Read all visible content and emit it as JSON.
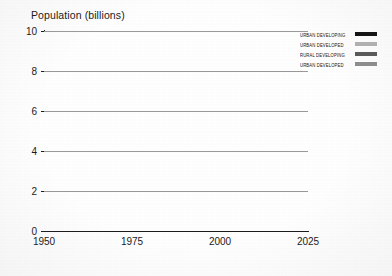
{
  "chart_data": {
    "type": "line",
    "title": "Population (billions)",
    "xlabel": "",
    "ylabel": "Population (billions)",
    "xlim": [
      1950,
      2025
    ],
    "ylim": [
      0,
      10
    ],
    "yticks": [
      0,
      2,
      4,
      6,
      8,
      10
    ],
    "xticks": [
      1950,
      1975,
      2000,
      2025
    ],
    "grid": true,
    "legend_position": "top-right",
    "x": [
      1950,
      1955,
      1960,
      1965,
      1970,
      1975,
      1980,
      1985,
      1990,
      1995,
      2000,
      2005,
      2010,
      2015,
      2020,
      2025
    ],
    "series": [
      {
        "name": "URBAN DEVELOPING",
        "color": "#111111",
        "values": [
          2.8,
          3.0,
          3.2,
          3.45,
          3.8,
          4.2,
          4.7,
          5.2,
          5.7,
          6.2,
          6.7,
          7.1,
          7.5,
          7.9,
          8.3,
          8.7
        ]
      },
      {
        "name": "URBAN DEVELOPED",
        "color": "#b3b3b3",
        "values": [
          1.8,
          1.85,
          1.9,
          1.98,
          2.15,
          2.45,
          2.8,
          3.1,
          3.4,
          3.65,
          3.9,
          4.05,
          4.15,
          4.2,
          4.22,
          4.2
        ]
      },
      {
        "name": "RURAL DEVELOPING",
        "color": "#5a5a5a",
        "values": [
          2.0,
          2.0,
          1.95,
          1.92,
          1.95,
          2.05,
          2.25,
          2.45,
          2.6,
          2.75,
          2.9,
          3.0,
          3.1,
          3.15,
          3.15,
          3.1
        ]
      },
      {
        "name": "URBAN DEVELOPED",
        "color": "#8e8e8e",
        "values": [
          0.62,
          0.61,
          0.6,
          0.59,
          0.58,
          0.56,
          0.54,
          0.52,
          0.5,
          0.48,
          0.46,
          0.44,
          0.42,
          0.4,
          0.38,
          0.35
        ]
      }
    ]
  },
  "legend": {
    "items": [
      {
        "label": "URBAN DEVELOPING",
        "swatch_class": "sw-urban-developing"
      },
      {
        "label": "URBAN DEVELOPED",
        "swatch_class": "sw-urban-developed"
      },
      {
        "label": "RURAL DEVELOPING",
        "swatch_class": "sw-rural-developing"
      },
      {
        "label": "URBAN DEVELOPED",
        "swatch_class": "sw-rural-developed"
      }
    ]
  }
}
